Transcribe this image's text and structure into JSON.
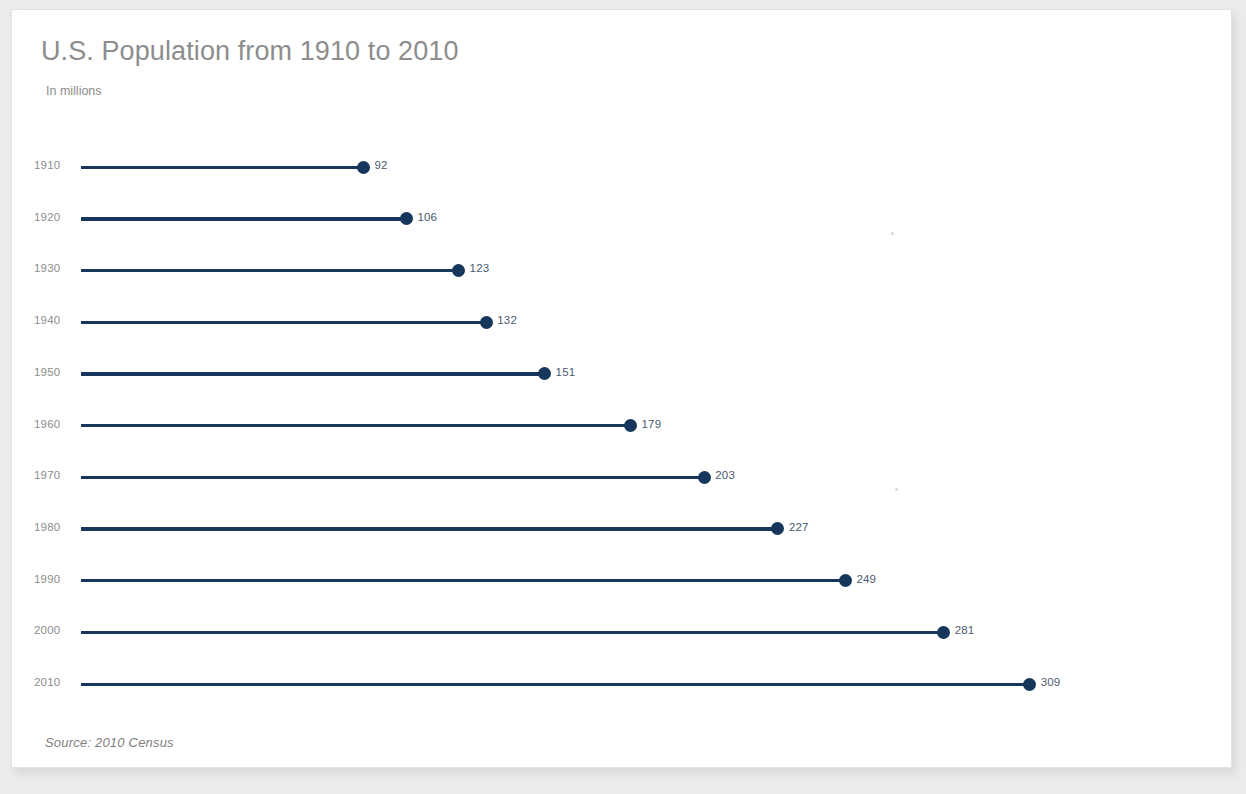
{
  "chart_data": {
    "type": "bar",
    "subtype": "lollipop-horizontal",
    "title": "U.S. Population from 1910 to 2010",
    "subtitle": "In millions",
    "source": "Source: 2010 Census",
    "xlabel": "",
    "ylabel": "",
    "unit": "millions",
    "xlim": [
      0,
      340
    ],
    "grid": false,
    "legend": null,
    "categories": [
      "1910",
      "1920",
      "1930",
      "1940",
      "1950",
      "1960",
      "1970",
      "1980",
      "1990",
      "2000",
      "2010"
    ],
    "values": [
      92,
      106,
      123,
      132,
      151,
      179,
      203,
      227,
      249,
      281,
      309
    ],
    "value_labels": [
      "92",
      "106",
      "123",
      "132",
      "151",
      "179",
      "203",
      "227",
      "249",
      "281",
      "309"
    ],
    "points": [
      {
        "category": "1910",
        "value": 92,
        "label": "92"
      },
      {
        "category": "1920",
        "value": 106,
        "label": "106"
      },
      {
        "category": "1930",
        "value": 123,
        "label": "123"
      },
      {
        "category": "1940",
        "value": 132,
        "label": "132"
      },
      {
        "category": "1950",
        "value": 151,
        "label": "151"
      },
      {
        "category": "1960",
        "value": 179,
        "label": "179"
      },
      {
        "category": "1970",
        "value": 203,
        "label": "203"
      },
      {
        "category": "1980",
        "value": 227,
        "label": "227"
      },
      {
        "category": "1990",
        "value": 249,
        "label": "249"
      },
      {
        "category": "2000",
        "value": 281,
        "label": "281"
      },
      {
        "category": "2010",
        "value": 309,
        "label": "309"
      }
    ],
    "colors": {
      "line": "#17365c",
      "marker": "#16365c",
      "title": "#8d8d8d",
      "subtitle": "#8d8d8d",
      "category_label": "#8d8d8d",
      "value_label": "#4a5a70",
      "source": "#7f7f7f",
      "card_background": "#ffffff",
      "page_background": "#ececed"
    }
  }
}
